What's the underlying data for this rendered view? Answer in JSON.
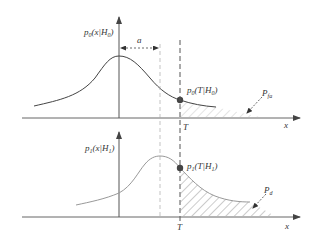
{
  "diagram": {
    "top_panel": {
      "y_label": "p0(x|H0)",
      "y_label_parts": {
        "p": "p",
        "sub": "0",
        "rest": "(x|H",
        "sub2": "0",
        "close": ")"
      },
      "x_label": "x",
      "point_label_parts": {
        "p": "p",
        "sub": "0",
        "rest": "(T|H",
        "sub2": "0",
        "close": ")"
      },
      "area_label_parts": {
        "p": "P",
        "sub": "fa"
      },
      "offset_label": "a"
    },
    "bottom_panel": {
      "y_label_parts": {
        "p": "p",
        "sub": "1",
        "rest": "(x|H",
        "sub2": "1",
        "close": ")"
      },
      "x_label": "x",
      "point_label_parts": {
        "p": "p",
        "sub": "1",
        "rest": "(T|H",
        "sub2": "1",
        "close": ")"
      },
      "area_label_parts": {
        "p": "P",
        "sub": "d"
      }
    },
    "threshold_label": "T",
    "colors": {
      "axis": "#555555",
      "curve": "#444444",
      "curve_light": "#888888",
      "hatch": "#999999",
      "point": "#444444"
    }
  }
}
